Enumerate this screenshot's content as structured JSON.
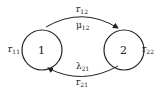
{
  "diagram": {
    "type": "state-transition",
    "states": [
      {
        "id": "1",
        "label": "1",
        "self_loop": {
          "base": "r",
          "sub": "11"
        }
      },
      {
        "id": "2",
        "label": "2",
        "self_loop": {
          "base": "r",
          "sub": "22"
        }
      }
    ],
    "edges": [
      {
        "from": "1",
        "to": "2",
        "rate": {
          "base": "r",
          "sub": "12"
        },
        "param": {
          "base": "μ",
          "sub": "12"
        }
      },
      {
        "from": "2",
        "to": "1",
        "rate": {
          "base": "r",
          "sub": "21"
        },
        "param": {
          "base": "λ",
          "sub": "21"
        }
      }
    ]
  },
  "colors": {
    "stroke": "#222222",
    "background": "#ffffff"
  }
}
